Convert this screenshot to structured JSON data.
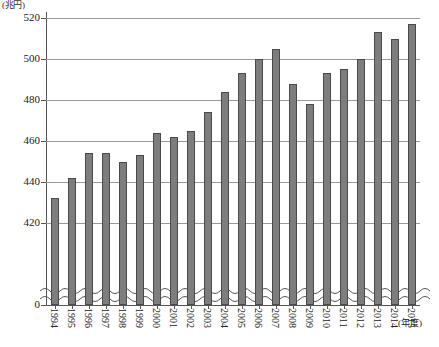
{
  "chart_data": {
    "type": "bar",
    "title": "",
    "unit_label": "(兆円)",
    "xlabel": "(年度)",
    "ylabel": "",
    "ylim": [
      416,
      524
    ],
    "axis_break": true,
    "axis_break_base": 0,
    "grid": true,
    "legend": "none",
    "bar_color": "#7d7d7d",
    "bar_edge_color": "#4a4a4a",
    "ytick_labels": [
      "520",
      "500",
      "480",
      "460",
      "440",
      "420",
      "0"
    ],
    "ytick_values": [
      520,
      500,
      480,
      460,
      440,
      420,
      0
    ],
    "categories": [
      "1994",
      "1995",
      "1996",
      "1997",
      "1998",
      "1999",
      "2000",
      "2001",
      "2002",
      "2003",
      "2004",
      "2005",
      "2006",
      "2007",
      "2008",
      "2009",
      "2010",
      "2011",
      "2012",
      "2013",
      "2014",
      "2015"
    ],
    "values": [
      432,
      442,
      454,
      454,
      450,
      453,
      464,
      462,
      465,
      474,
      484,
      493,
      500,
      505,
      488,
      478,
      493,
      495,
      500,
      513,
      510,
      517
    ]
  }
}
